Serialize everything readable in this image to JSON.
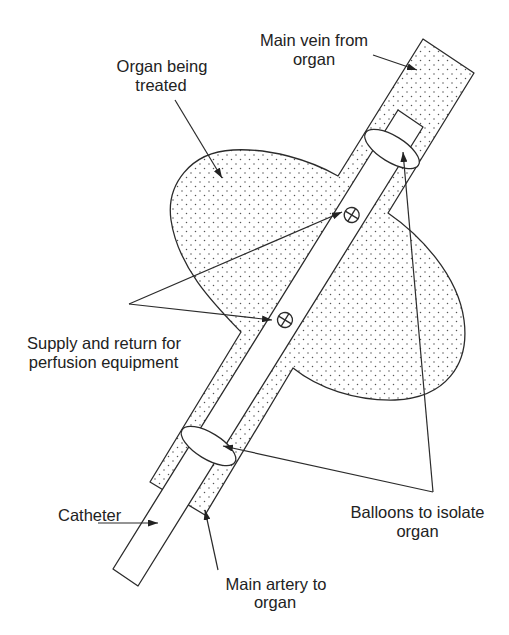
{
  "figure": {
    "type": "schematic",
    "labels": {
      "main_vein": {
        "line1": "Main vein from",
        "line2": "organ"
      },
      "organ": {
        "line1": "Organ being",
        "line2": "treated"
      },
      "supply_return": {
        "line1": "Supply and return for",
        "line2": "perfusion equipment"
      },
      "catheter": {
        "line1": "Catheter"
      },
      "main_artery": {
        "line1": "Main artery to",
        "line2": "organ"
      },
      "balloons": {
        "line1": "Balloons to isolate",
        "line2": "organ"
      }
    }
  },
  "colors": {
    "background": "#ffffff",
    "line": "#2b2b2b",
    "stipple": "#555555",
    "text": "#222222"
  }
}
